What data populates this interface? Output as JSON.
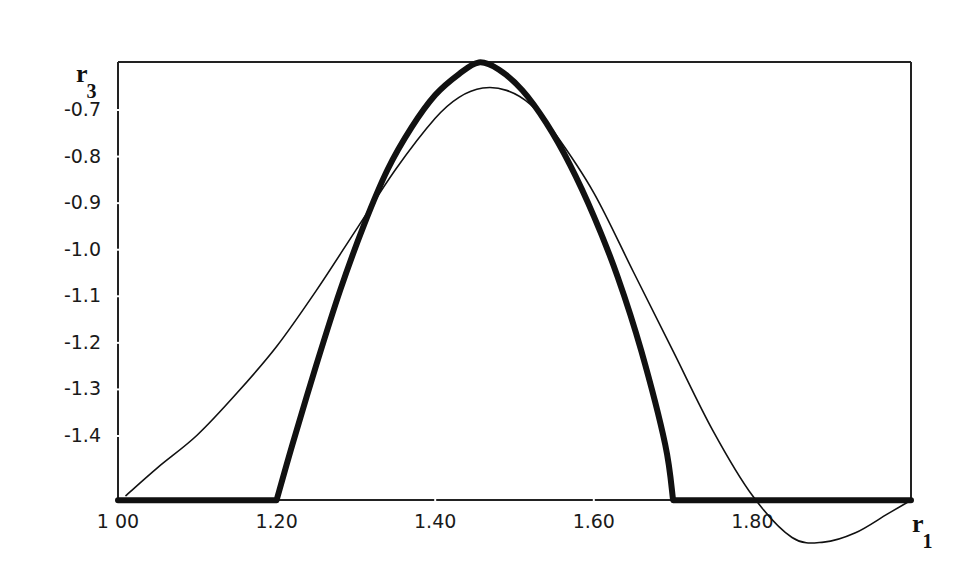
{
  "chart_data": {
    "type": "line",
    "title": "",
    "xlabel": "r",
    "xlabel_subscript": "1",
    "ylabel": "r",
    "ylabel_subscript": "3",
    "xlim": [
      1.0,
      2.0
    ],
    "ylim": [
      -1.54,
      -0.6
    ],
    "x_ticks": [
      "1 00",
      "1.20",
      "1.40",
      "1.60",
      "1.80"
    ],
    "x_tick_values": [
      1.0,
      1.2,
      1.4,
      1.6,
      1.8
    ],
    "y_ticks": [
      "-0.7",
      "-0.8",
      "-0.9",
      "-1.0",
      "-1.1",
      "-1.2",
      "-1.3",
      "-1.4"
    ],
    "y_tick_values": [
      -0.7,
      -0.8,
      -0.9,
      -1.0,
      -1.1,
      -1.2,
      -1.3,
      -1.4
    ],
    "grid": false,
    "legend": null,
    "series": [
      {
        "name": "thick curve",
        "style": "thick",
        "x": [
          1.0,
          1.2,
          1.22,
          1.25,
          1.28,
          1.31,
          1.34,
          1.37,
          1.4,
          1.43,
          1.455,
          1.48,
          1.51,
          1.54,
          1.57,
          1.6,
          1.63,
          1.66,
          1.69,
          1.7,
          2.0
        ],
        "y": [
          -1.54,
          -1.54,
          -1.42,
          -1.25,
          -1.09,
          -0.95,
          -0.83,
          -0.74,
          -0.67,
          -0.625,
          -0.6,
          -0.615,
          -0.66,
          -0.73,
          -0.82,
          -0.93,
          -1.06,
          -1.22,
          -1.42,
          -1.54,
          -1.54
        ]
      },
      {
        "name": "thin curve",
        "style": "thin",
        "x": [
          1.01,
          1.05,
          1.1,
          1.15,
          1.2,
          1.25,
          1.3,
          1.35,
          1.4,
          1.43,
          1.46,
          1.49,
          1.52,
          1.55,
          1.6,
          1.65,
          1.7,
          1.75,
          1.8,
          1.85,
          1.89,
          1.93,
          1.97,
          2.0
        ],
        "y": [
          -1.53,
          -1.47,
          -1.4,
          -1.31,
          -1.21,
          -1.09,
          -0.96,
          -0.83,
          -0.72,
          -0.675,
          -0.655,
          -0.66,
          -0.69,
          -0.75,
          -0.88,
          -1.05,
          -1.22,
          -1.39,
          -1.53,
          -1.62,
          -1.63,
          -1.61,
          -1.57,
          -1.54
        ]
      }
    ]
  }
}
